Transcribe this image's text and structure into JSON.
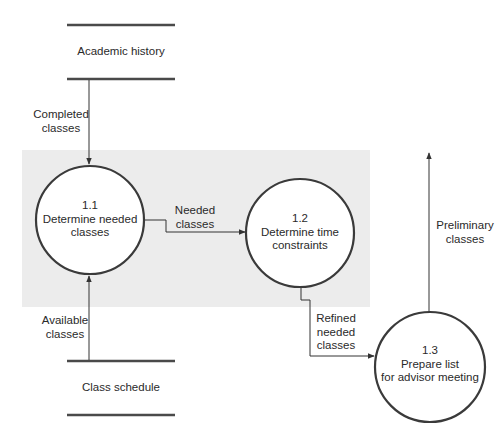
{
  "diagram": {
    "type": "data-flow-diagram",
    "data_stores": [
      {
        "id": "academic_history",
        "label": "Academic history"
      },
      {
        "id": "class_schedule",
        "label": "Class schedule"
      }
    ],
    "processes": [
      {
        "id": "1.1",
        "number": "1.1",
        "line1": "Determine needed",
        "line2": "classes"
      },
      {
        "id": "1.2",
        "number": "1.2",
        "line1": "Determine time",
        "line2": "constraints"
      },
      {
        "id": "1.3",
        "number": "1.3",
        "line1": "Prepare list",
        "line2": "for advisor meeting"
      }
    ],
    "flows": [
      {
        "from": "academic_history",
        "to": "1.1",
        "line1": "Completed",
        "line2": "classes"
      },
      {
        "from": "class_schedule",
        "to": "1.1",
        "line1": "Available",
        "line2": "classes"
      },
      {
        "from": "1.1",
        "to": "1.2",
        "line1": "Needed",
        "line2": "classes"
      },
      {
        "from": "1.2",
        "to": "1.3",
        "line1": "Refined",
        "line2": "needed",
        "line3": "classes"
      },
      {
        "from": "1.3",
        "to": "external",
        "line1": "Preliminary",
        "line2": "classes"
      }
    ]
  },
  "colors": {
    "shaded_region": "#ececec",
    "circle_stroke": "#3a3a3a",
    "line": "#333333",
    "store_line": "#4a4a4a"
  }
}
